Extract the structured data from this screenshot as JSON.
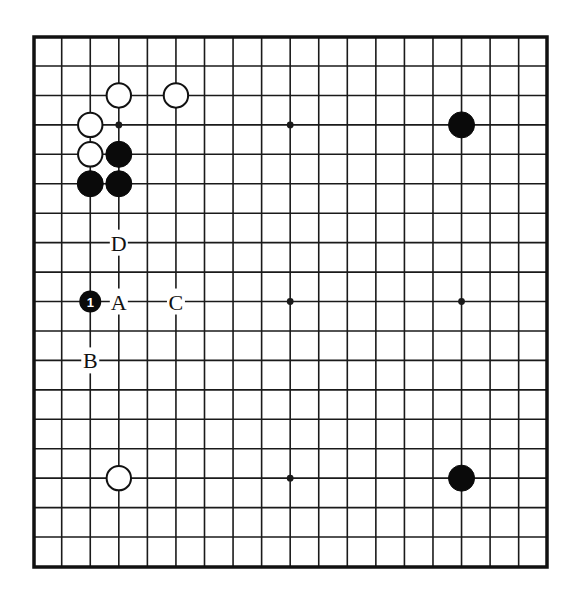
{
  "diagram": {
    "type": "go-board-partial",
    "frame": {
      "left": 34,
      "top": 37,
      "right": 547,
      "bottom": 567
    },
    "grid": {
      "cols": 17,
      "rows": 17,
      "x0": 61.7,
      "y0": 66,
      "dx": 28.56,
      "dy": 29.44
    },
    "colors": {
      "line": "#1a1a1a",
      "black_stone": "#0a0a0a",
      "white_stone_fill": "#ffffff",
      "white_stone_stroke": "#111111",
      "background": "#ffffff"
    },
    "star_points": [
      {
        "col": 2,
        "row": 2
      },
      {
        "col": 8,
        "row": 2
      },
      {
        "col": 8,
        "row": 8
      },
      {
        "col": 14,
        "row": 8
      },
      {
        "col": 8,
        "row": 14
      }
    ],
    "stones": [
      {
        "color": "white",
        "col": 2,
        "row": 1
      },
      {
        "color": "white",
        "col": 4,
        "row": 1
      },
      {
        "color": "white",
        "col": 1,
        "row": 2
      },
      {
        "color": "white",
        "col": 1,
        "row": 3
      },
      {
        "color": "black",
        "col": 2,
        "row": 3
      },
      {
        "color": "black",
        "col": 1,
        "row": 4
      },
      {
        "color": "black",
        "col": 2,
        "row": 4
      },
      {
        "color": "black",
        "col": 14,
        "row": 2
      },
      {
        "color": "white",
        "col": 2,
        "row": 14
      },
      {
        "color": "black",
        "col": 14,
        "row": 14
      }
    ],
    "numbered_stones": [
      {
        "color": "black",
        "col": 1,
        "row": 8,
        "number": "1"
      }
    ],
    "labels": [
      {
        "text": "D",
        "col": 2,
        "row": 6
      },
      {
        "text": "A",
        "col": 2,
        "row": 8
      },
      {
        "text": "C",
        "col": 4,
        "row": 8
      },
      {
        "text": "B",
        "col": 1,
        "row": 10
      }
    ]
  }
}
